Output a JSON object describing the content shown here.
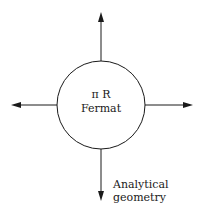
{
  "diagram": {
    "center": {
      "line1": "π R",
      "line2": "Fermat"
    },
    "arrows": [
      "up",
      "down",
      "left",
      "right"
    ],
    "bottom_label": {
      "line1": "Analytical",
      "line2": "geometry"
    },
    "colors": {
      "stroke": "#1a1a1a",
      "background": "#ffffff"
    }
  }
}
